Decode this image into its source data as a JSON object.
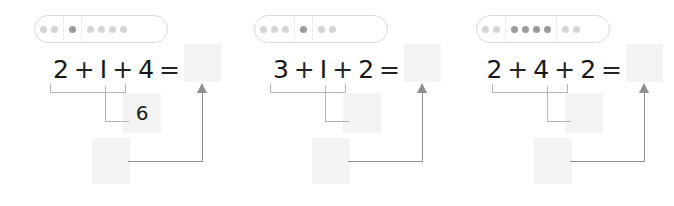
{
  "worksheet": {
    "title": "Addition with grouping brackets worksheet",
    "background_color": "#ffffff",
    "groups": [
      {
        "id": "group-1",
        "dot_strip": {
          "sections": [
            {
              "count": 2,
              "highlighted": false
            },
            {
              "count": 1,
              "highlighted": true
            },
            {
              "count": 4,
              "highlighted": false
            }
          ]
        },
        "equation": {
          "term_1": "2",
          "operator_1": "+",
          "term_2": "I",
          "operator_2": "+",
          "term_3": "4",
          "equals": "="
        },
        "answer_box_value": "",
        "mid_box_value": "6",
        "low_box_value": ""
      },
      {
        "id": "group-2",
        "dot_strip": {
          "sections": [
            {
              "count": 3,
              "highlighted": false
            },
            {
              "count": 1,
              "highlighted": true
            },
            {
              "count": 2,
              "highlighted": false
            }
          ]
        },
        "equation": {
          "term_1": "3",
          "operator_1": "+",
          "term_2": "I",
          "operator_2": "+",
          "term_3": "2",
          "equals": "="
        },
        "answer_box_value": "",
        "mid_box_value": "",
        "low_box_value": ""
      },
      {
        "id": "group-3",
        "dot_strip": {
          "sections": [
            {
              "count": 2,
              "highlighted": false
            },
            {
              "count": 4,
              "highlighted": true
            },
            {
              "count": 2,
              "highlighted": false
            }
          ]
        },
        "equation": {
          "term_1": "2",
          "operator_1": "+",
          "term_2": "4",
          "operator_2": "+",
          "term_3": "2",
          "equals": "="
        },
        "answer_box_value": "",
        "mid_box_value": "",
        "low_box_value": ""
      }
    ]
  },
  "colors": {
    "dot_inactive": "#d5d5d5",
    "dot_active": "#9b9b9b",
    "strip_border": "#d9d9d9",
    "box_fill": "#f3f3f3",
    "bracket_line": "#b4b4b4",
    "arrow_line": "#8f8f8f",
    "text": "#161616"
  }
}
